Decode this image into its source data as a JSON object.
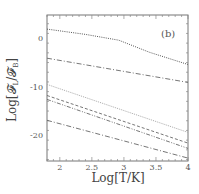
{
  "chart_data": {
    "type": "line",
    "title": "",
    "panel_label": "(b)",
    "xlabel": "Log[T/K]",
    "ylabel": "Log[𝓕L/𝓕B]",
    "xlim": [
      1.8,
      4.0
    ],
    "ylim": [
      -25.3,
      4.8
    ],
    "x_ticks": [
      2,
      2.5,
      3,
      3.5,
      4
    ],
    "x_tick_labels": [
      "2",
      "2.5",
      "3",
      "3.5",
      "4"
    ],
    "y_ticks": [
      0,
      -10,
      -20
    ],
    "y_tick_labels": [
      "0",
      "-10",
      "-20"
    ],
    "grid": false,
    "legend": null,
    "series": [
      {
        "name": "curve-1",
        "style": "dotted",
        "x": [
          1.8,
          2.4,
          2.92,
          3.4,
          4.0
        ],
        "values": [
          1.9,
          0.8,
          -0.4,
          -2.9,
          -5.4
        ]
      },
      {
        "name": "curve-2",
        "style": "dash-dot",
        "x": [
          1.8,
          4.0
        ],
        "values": [
          -4.1,
          -9.1
        ]
      },
      {
        "name": "curve-3",
        "style": "dotted-light",
        "x": [
          1.8,
          4.0
        ],
        "values": [
          -9.5,
          -19.4
        ]
      },
      {
        "name": "curve-4",
        "style": "dashed",
        "x": [
          1.8,
          4.0
        ],
        "values": [
          -11.8,
          -21.6
        ]
      },
      {
        "name": "curve-5",
        "style": "dash-dot-dot",
        "x": [
          1.8,
          4.0
        ],
        "values": [
          -12.6,
          -22.7
        ]
      },
      {
        "name": "curve-6",
        "style": "dash-dot",
        "x": [
          1.8,
          4.0
        ],
        "values": [
          -16.9,
          -24.7
        ]
      }
    ]
  },
  "labels": {
    "panel": "(b)",
    "xlabel": "Log[T/K]",
    "ylabel_main": "Log[",
    "ylabel_f1": "𝓕",
    "ylabel_sub1": "L",
    "ylabel_slash": "/",
    "ylabel_f2": "𝓕",
    "ylabel_sub2": "B",
    "ylabel_close": "]"
  }
}
